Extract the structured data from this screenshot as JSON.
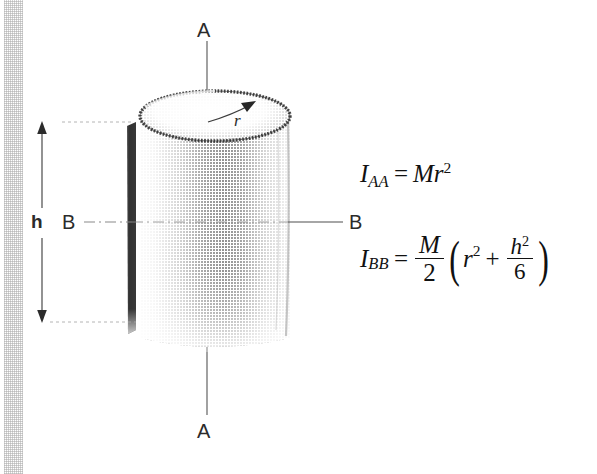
{
  "figure": {
    "labels": {
      "axis_top": "A",
      "axis_bottom": "A",
      "b_left": "B",
      "b_right": "B",
      "height": "h",
      "radius": "r"
    },
    "formula_aa": {
      "lhs_symbol": "I",
      "lhs_subscript": "AA",
      "equals": "=",
      "mass": "M",
      "radius": "r",
      "radius_exponent": "2"
    },
    "formula_bb": {
      "lhs_symbol": "I",
      "lhs_subscript": "BB",
      "equals": "=",
      "coefficient_numerator": "M",
      "coefficient_denominator": "2",
      "paren_open": "(",
      "term1": "r",
      "term1_exponent": "2",
      "plus": "+",
      "term2_numerator": "h",
      "term2_numerator_exponent": "2",
      "term2_denominator": "6",
      "paren_close": ")"
    },
    "colors": {
      "ink": "#1a1a1a",
      "formula_ink": "#111111",
      "label_ink": "#2b2b2b",
      "cylinder_dark_edge": "#2a2a2a",
      "cylinder_shade": "#8c8c8c",
      "guide_line": "#9a9a9a",
      "scan_strip": "#8c8c8c"
    }
  }
}
